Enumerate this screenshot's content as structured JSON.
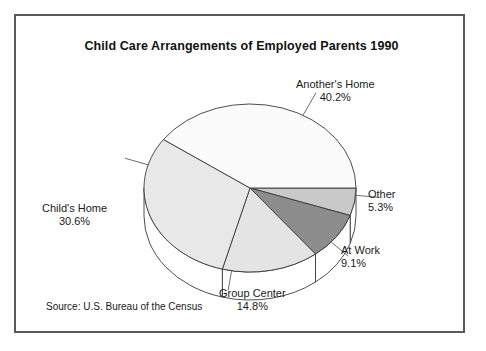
{
  "figure": {
    "title": "Child Care Arrangements of Employed Parents 1990",
    "source_note": "Source: U.S. Bureau of the Census",
    "border_color": "#5a5a5a",
    "background": "#ffffff"
  },
  "chart_data": {
    "type": "pie",
    "title": "Child Care Arrangements of Employed Parents 1990",
    "subtitle": "",
    "xlabel": "",
    "ylabel": "",
    "three_d": true,
    "start_angle_deg": 0,
    "direction": "clockwise",
    "legend_position": "outside-labels",
    "grid": false,
    "units": "percent",
    "categories": [
      "Other",
      "At Work",
      "Group Center",
      "Child's Home",
      "Another's Home"
    ],
    "values": [
      5.3,
      9.1,
      14.8,
      30.6,
      40.2
    ],
    "annotations": [
      "Source: U.S. Bureau of the Census"
    ],
    "slices": [
      {
        "label": "Other",
        "value": 5.3,
        "value_text": "5.3%",
        "color": "#c9c9c9",
        "outline": "#3a3a3a"
      },
      {
        "label": "At Work",
        "value": 9.1,
        "value_text": "9.1%",
        "color": "#8d8d8d",
        "outline": "#3a3a3a"
      },
      {
        "label": "Group Center",
        "value": 14.8,
        "value_text": "14.8%",
        "color": "#e4e4e4",
        "outline": "#3a3a3a"
      },
      {
        "label": "Child's Home",
        "value": 30.6,
        "value_text": "30.6%",
        "color": "#e8e8e8",
        "outline": "#3a3a3a"
      },
      {
        "label": "Another's Home",
        "value": 40.2,
        "value_text": "40.2%",
        "color": "#fbfbfb",
        "outline": "#3a3a3a"
      }
    ]
  },
  "labels": {
    "anothers_home": {
      "name": "Another's Home",
      "pct": "40.2%"
    },
    "other": {
      "name": "Other",
      "pct": "5.3%"
    },
    "at_work": {
      "name": "At Work",
      "pct": "9.1%"
    },
    "group_center": {
      "name": "Group Center",
      "pct": "14.8%"
    },
    "childs_home": {
      "name": "Child's Home",
      "pct": "30.6%"
    }
  }
}
